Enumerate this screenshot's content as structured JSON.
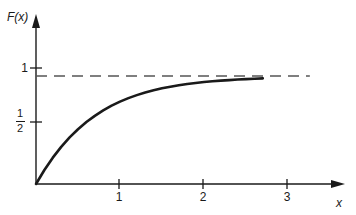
{
  "chart_data": {
    "type": "line",
    "title": "",
    "subtitle": "",
    "xlabel": "x",
    "ylabel": "F(x)",
    "xlim": [
      0,
      3.25
    ],
    "ylim": [
      0,
      1.18
    ],
    "grid": false,
    "legend": null,
    "x_ticks": [
      "1",
      "2",
      "3"
    ],
    "x_tick_values": [
      1,
      2,
      3
    ],
    "y_ticks": [
      "1/2",
      "1"
    ],
    "y_tick_values": [
      0.5,
      1
    ],
    "y_tick_half_numerator": "1",
    "y_tick_half_denominator": "2",
    "series": [
      {
        "name": "F(x)",
        "style": "solid",
        "color": "#1a1a1a",
        "width": 2.6,
        "x": [
          0,
          0.1,
          0.2,
          0.3,
          0.4,
          0.5,
          0.6,
          0.7,
          0.8,
          0.9,
          1.0,
          1.1,
          1.2,
          1.3,
          1.4,
          1.5,
          1.6,
          1.7,
          1.8,
          1.9,
          2.0,
          2.1,
          2.2,
          2.3,
          2.4,
          2.5,
          2.6,
          2.7
        ],
        "values": [
          0.0,
          0.13,
          0.244,
          0.344,
          0.432,
          0.507,
          0.574,
          0.631,
          0.681,
          0.725,
          0.763,
          0.795,
          0.823,
          0.848,
          0.868,
          0.886,
          0.901,
          0.914,
          0.926,
          0.935,
          0.944,
          0.951,
          0.957,
          0.962,
          0.967,
          0.971,
          0.975,
          0.978
        ]
      },
      {
        "name": "asymptote",
        "style": "dashed",
        "color": "#555555",
        "width": 1.2,
        "x": [
          0,
          3.26
        ],
        "values": [
          1,
          1
        ]
      }
    ],
    "annotations": [
      {
        "text": "F(x)",
        "role": "y-axis-label"
      },
      {
        "text": "x",
        "role": "x-axis-label"
      }
    ],
    "axes": {
      "x_arrow": true,
      "y_arrow": true,
      "origin_label": ""
    }
  },
  "figure": {
    "background_color": "#ffffff",
    "axis_color": "#1a1a1a",
    "curve_color": "#1a1a1a",
    "dash_color": "#555555"
  }
}
